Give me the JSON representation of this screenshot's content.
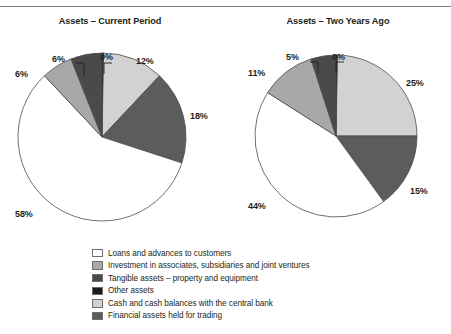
{
  "figure": {
    "has_top_rule": true,
    "background": "#ffffff"
  },
  "charts": [
    {
      "id": "current-period",
      "title": "Assets – Current Period",
      "labels": [
        "0%",
        "12%",
        "18%",
        "58%",
        "6%",
        "6%"
      ]
    },
    {
      "id": "two-years-ago",
      "title": "Assets – Two Years Ago",
      "labels": [
        "0%",
        "25%",
        "15%",
        "44%",
        "11%",
        "5%"
      ]
    }
  ],
  "legend": {
    "items": [
      {
        "label": "Loans and advances to customers",
        "color": "#ffffff"
      },
      {
        "label": "Investment in associates, subsidiaries and joint ventures",
        "color": "#a8a8a8"
      },
      {
        "label": "Tangible assets – property and equipment",
        "color": "#4a4a4a"
      },
      {
        "label": "Other assets",
        "color": "#1c1c1c"
      },
      {
        "label": "Cash and cash balances with the central bank",
        "color": "#d2d2d2"
      },
      {
        "label": "Financial assets held for trading",
        "color": "#5c5c5c"
      }
    ]
  },
  "chart_data": [
    {
      "type": "pie",
      "title": "Assets – Current Period",
      "categories": [
        "Cash and cash balances with the central bank",
        "Financial assets held for trading",
        "Loans and advances to customers",
        "Investment in associates, subsidiaries and joint ventures",
        "Tangible assets – property and equipment",
        "Other assets"
      ],
      "values": [
        12,
        18,
        58,
        6,
        6,
        0
      ],
      "value_labels": [
        "12%",
        "18%",
        "58%",
        "6%",
        "6%",
        "0%"
      ],
      "colors": [
        "#d2d2d2",
        "#5c5c5c",
        "#ffffff",
        "#a8a8a8",
        "#4a4a4a",
        "#1c1c1c"
      ],
      "units": "percent",
      "start_angle_deg": 0,
      "direction": "clockwise",
      "legend_position": "bottom-center",
      "grid": false
    },
    {
      "type": "pie",
      "title": "Assets – Two Years Ago",
      "categories": [
        "Cash and cash balances with the central bank",
        "Financial assets held for trading",
        "Loans and advances to customers",
        "Investment in associates, subsidiaries and joint ventures",
        "Tangible assets – property and equipment",
        "Other assets"
      ],
      "values": [
        25,
        15,
        44,
        11,
        5,
        0
      ],
      "value_labels": [
        "25%",
        "15%",
        "44%",
        "11%",
        "5%",
        "0%"
      ],
      "colors": [
        "#d2d2d2",
        "#5c5c5c",
        "#ffffff",
        "#a8a8a8",
        "#4a4a4a",
        "#1c1c1c"
      ],
      "units": "percent",
      "start_angle_deg": 0,
      "direction": "clockwise",
      "legend_position": "bottom-center",
      "grid": false
    }
  ]
}
